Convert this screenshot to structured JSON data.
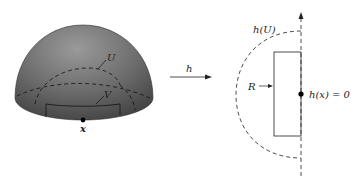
{
  "diagram": {
    "left": {
      "labels": {
        "U": "U",
        "V": "V",
        "x": "x"
      },
      "surface_color": "#6e6e6e"
    },
    "arrow": {
      "label": "h"
    },
    "right": {
      "labels": {
        "hU": "h(U)",
        "R": "R",
        "hx": "h(x) = 0"
      }
    }
  }
}
